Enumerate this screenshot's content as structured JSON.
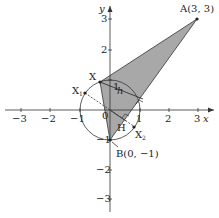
{
  "figure": {
    "axes": {
      "x_label": "x",
      "y_label": "y",
      "origin_label": "0",
      "x_ticks": [
        "−3",
        "−2",
        "−1",
        "1",
        "2",
        "3"
      ],
      "y_ticks": [
        "3",
        "2",
        "1",
        "−1",
        "−2",
        "−3"
      ]
    },
    "points": {
      "A": "A(3, 3)",
      "B": "B(0, −1)",
      "X": "X",
      "X1": "X",
      "X1_sub": "1",
      "X2": "X",
      "X2_sub": "2",
      "H": "H"
    },
    "segment_label": "h",
    "colors": {
      "shade": "#a8a8a8",
      "line": "#333333",
      "axis": "#333333"
    },
    "shapes": {
      "circle": "unit circle centered at origin",
      "triangle": "ABX shaded"
    }
  }
}
